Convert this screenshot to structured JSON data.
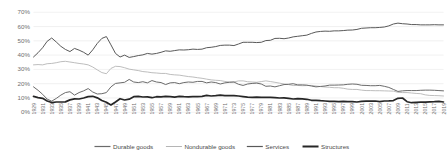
{
  "chart_data": {
    "type": "line",
    "title": "",
    "subtitle": "",
    "xlabel": "",
    "ylabel": "",
    "ylim": [
      0,
      70
    ],
    "ytick_labels": [
      "0%",
      "10%",
      "20%",
      "30%",
      "40%",
      "50%",
      "60%",
      "70%"
    ],
    "ytick_values": [
      0,
      10,
      20,
      30,
      40,
      50,
      60,
      70
    ],
    "grid": true,
    "legend_position": "bottom",
    "x_start": 1929,
    "x_end": 2019,
    "xtick_step": 2,
    "xtick_labels": [
      "1929",
      "1931",
      "1933",
      "1935",
      "1937",
      "1939",
      "1941",
      "1943",
      "1945",
      "1947",
      "1949",
      "1951",
      "1953",
      "1955",
      "1957",
      "1959",
      "1961",
      "1963",
      "1965",
      "1967",
      "1969",
      "1971",
      "1973",
      "1975",
      "1977",
      "1979",
      "1981",
      "1983",
      "1985",
      "1987",
      "1989",
      "1991",
      "1993",
      "1995",
      "1997",
      "1999",
      "2001",
      "2003",
      "2005",
      "2007",
      "2009",
      "2011",
      "2013",
      "2015",
      "2017",
      "2019"
    ],
    "x": [
      1929,
      1930,
      1931,
      1932,
      1933,
      1934,
      1935,
      1936,
      1937,
      1938,
      1939,
      1940,
      1941,
      1942,
      1943,
      1944,
      1945,
      1946,
      1947,
      1948,
      1949,
      1950,
      1951,
      1952,
      1953,
      1954,
      1955,
      1956,
      1957,
      1958,
      1959,
      1960,
      1961,
      1962,
      1963,
      1964,
      1965,
      1966,
      1967,
      1968,
      1969,
      1970,
      1971,
      1972,
      1973,
      1974,
      1975,
      1976,
      1977,
      1978,
      1979,
      1980,
      1981,
      1982,
      1983,
      1984,
      1985,
      1986,
      1987,
      1988,
      1989,
      1990,
      1991,
      1992,
      1993,
      1994,
      1995,
      1996,
      1997,
      1998,
      1999,
      2000,
      2001,
      2002,
      2003,
      2004,
      2005,
      2006,
      2007,
      2008,
      2009,
      2010,
      2011,
      2012,
      2013,
      2014,
      2015,
      2016,
      2017,
      2018,
      2019
    ],
    "series": [
      {
        "name": "Services",
        "color": "#595959",
        "width": 1.0,
        "values": [
          38.5,
          41.5,
          45.0,
          49.5,
          51.8,
          49.0,
          46.0,
          43.8,
          42.3,
          44.5,
          43.3,
          41.8,
          39.8,
          43.5,
          48.0,
          51.5,
          52.8,
          47.0,
          41.0,
          38.5,
          39.8,
          38.2,
          38.8,
          39.5,
          40.0,
          41.0,
          40.5,
          41.0,
          41.8,
          42.8,
          42.5,
          43.0,
          43.5,
          43.4,
          43.6,
          44.0,
          43.8,
          44.0,
          45.0,
          45.3,
          45.8,
          46.6,
          46.8,
          46.8,
          46.5,
          47.6,
          48.8,
          48.8,
          48.8,
          48.6,
          48.8,
          50.0,
          50.2,
          51.5,
          51.6,
          51.3,
          51.8,
          52.6,
          53.0,
          53.4,
          53.8,
          55.0,
          56.0,
          56.4,
          56.6,
          56.5,
          56.8,
          56.8,
          57.0,
          57.3,
          57.4,
          57.8,
          58.6,
          58.8,
          59.0,
          59.0,
          59.2,
          59.5,
          60.3,
          61.6,
          62.2,
          61.8,
          61.6,
          61.2,
          61.2,
          61.0,
          61.0,
          61.0,
          61.1,
          61.0,
          61.0
        ]
      },
      {
        "name": "Nondurable goods",
        "color": "#b5b5b5",
        "width": 0.9,
        "values": [
          33.0,
          33.2,
          33.0,
          33.8,
          34.0,
          34.5,
          35.2,
          35.5,
          35.0,
          34.5,
          34.0,
          33.6,
          33.0,
          31.5,
          29.5,
          27.6,
          26.8,
          30.5,
          32.0,
          31.8,
          31.0,
          30.0,
          29.5,
          29.0,
          28.3,
          28.0,
          27.5,
          27.3,
          27.0,
          27.0,
          26.3,
          26.0,
          25.8,
          25.3,
          24.8,
          24.5,
          24.0,
          23.6,
          23.0,
          22.5,
          22.2,
          22.0,
          21.4,
          21.0,
          21.0,
          21.8,
          21.8,
          21.2,
          21.0,
          20.8,
          21.3,
          21.8,
          21.3,
          20.8,
          20.2,
          19.6,
          19.2,
          18.5,
          18.6,
          18.4,
          18.5,
          18.6,
          18.2,
          17.8,
          17.5,
          17.3,
          17.0,
          17.0,
          16.6,
          16.0,
          15.8,
          15.8,
          15.3,
          15.0,
          15.0,
          14.9,
          14.9,
          14.8,
          14.7,
          14.6,
          13.8,
          13.6,
          13.6,
          13.3,
          13.0,
          12.8,
          12.0,
          11.6,
          11.5,
          11.4,
          11.2
        ]
      },
      {
        "name": "Durable goods",
        "color": "#6b6b6b",
        "width": 1.0,
        "values": [
          17.6,
          15.2,
          12.4,
          9.0,
          7.6,
          9.5,
          11.8,
          13.6,
          14.2,
          11.8,
          13.6,
          14.8,
          16.4,
          14.0,
          12.6,
          12.8,
          13.6,
          17.6,
          20.0,
          20.4,
          20.8,
          22.8,
          21.0,
          20.6,
          21.2,
          20.4,
          22.0,
          21.0,
          20.6,
          19.2,
          20.4,
          20.6,
          19.8,
          20.6,
          21.0,
          20.8,
          21.4,
          21.4,
          20.4,
          21.0,
          20.6,
          19.6,
          20.4,
          20.8,
          21.0,
          19.4,
          18.6,
          19.6,
          20.0,
          20.2,
          19.6,
          18.0,
          18.2,
          17.6,
          18.4,
          19.2,
          19.4,
          19.8,
          19.0,
          19.0,
          18.8,
          18.2,
          17.6,
          17.9,
          18.2,
          18.8,
          18.8,
          18.9,
          19.0,
          19.4,
          19.6,
          19.4,
          18.7,
          18.6,
          18.4,
          18.4,
          18.6,
          18.0,
          17.2,
          15.8,
          14.4,
          14.8,
          15.0,
          15.0,
          15.0,
          15.2,
          15.3,
          15.3,
          15.2,
          15.0,
          14.8
        ]
      },
      {
        "name": "Structures",
        "color": "#262626",
        "width": 1.7,
        "values": [
          10.9,
          10.1,
          9.6,
          7.7,
          6.6,
          7.0,
          7.0,
          7.1,
          8.5,
          9.2,
          9.1,
          9.8,
          10.8,
          11.0,
          9.9,
          8.1,
          6.8,
          4.9,
          7.0,
          9.3,
          8.4,
          9.0,
          10.7,
          10.9,
          10.5,
          10.6,
          10.0,
          10.7,
          10.6,
          11.0,
          10.8,
          10.4,
          10.9,
          10.7,
          10.6,
          10.7,
          10.8,
          11.0,
          11.6,
          11.2,
          11.4,
          11.8,
          11.4,
          11.4,
          11.5,
          11.2,
          10.8,
          10.4,
          10.2,
          10.4,
          10.3,
          10.2,
          10.3,
          10.1,
          9.8,
          9.9,
          9.6,
          9.1,
          9.4,
          9.2,
          8.9,
          8.2,
          8.2,
          7.9,
          7.7,
          7.4,
          7.4,
          7.3,
          7.4,
          7.3,
          7.2,
          7.0,
          7.4,
          7.6,
          7.6,
          7.7,
          7.3,
          7.7,
          7.8,
          8.0,
          9.6,
          9.8,
          7.2,
          6.5,
          6.8,
          6.9,
          6.9,
          7.1,
          7.2,
          7.4,
          7.0
        ]
      }
    ]
  },
  "legend": {
    "items": [
      {
        "label": "Durable goods",
        "color": "#6b6b6b",
        "width": 1.2
      },
      {
        "label": "Nondurable goods",
        "color": "#b5b5b5",
        "width": 1.0
      },
      {
        "label": "Services",
        "color": "#595959",
        "width": 1.2
      },
      {
        "label": "Structures",
        "color": "#262626",
        "width": 2.0
      }
    ]
  }
}
